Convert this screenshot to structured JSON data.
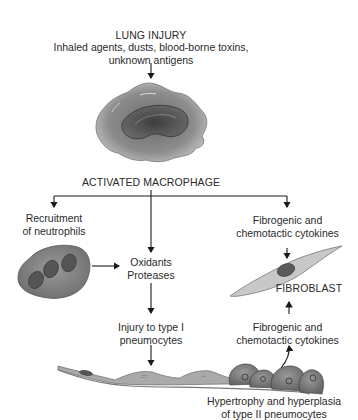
{
  "title": "LUNG INJURY",
  "causes": [
    "Inhaled agents, dusts, blood-borne toxins,",
    "unknown antigens"
  ],
  "nodes": {
    "macrophage": "ACTIVATED MACROPHAGE",
    "neutrophils": [
      "Recruitment",
      "of neutrophils"
    ],
    "oxidants": [
      "Oxidants",
      "Proteases"
    ],
    "cytokines_top": [
      "Fibrogenic and",
      "chemotactic cytokines"
    ],
    "fibroblast": "FIBROBLAST",
    "injury": [
      "Injury to type I",
      "pneumocytes"
    ],
    "cytokines_bottom": [
      "Fibrogenic and",
      "chemotactic cytokines"
    ],
    "hypertrophy": [
      "Hypertrophy and hyperplasia",
      "of type II pneumocytes"
    ]
  },
  "colors": {
    "line": "#1a1a1a",
    "cell_dark": "#555555",
    "cell_mid": "#8a8a8a",
    "cell_light": "#c4c4c4"
  }
}
